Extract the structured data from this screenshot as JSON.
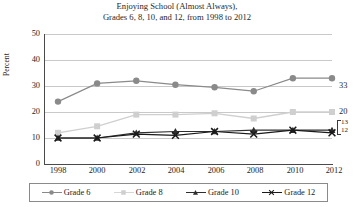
{
  "chart_data": {
    "type": "line",
    "title": "Enjoying School (Almost Always),",
    "subtitle": "Grades 6, 8, 10, and 12, from 1998 to 2012",
    "xlabel": "",
    "ylabel": "Percent",
    "x": [
      1998,
      2000,
      2002,
      2004,
      2006,
      2008,
      2010,
      2012
    ],
    "xticklabels": [
      "1998",
      "2000",
      "2002",
      "2004",
      "2006",
      "2008",
      "2010",
      "2012"
    ],
    "yticklabels": [
      "0",
      "10",
      "20",
      "30",
      "40",
      "50"
    ],
    "ylim": [
      0,
      50
    ],
    "ytick_step": 10,
    "grid": "horizontal",
    "legend_position": "bottom",
    "series": [
      {
        "name": "Grade 6",
        "marker": "circle",
        "color": "#8a8a8a",
        "values": [
          24,
          31,
          32,
          30.5,
          29.5,
          28,
          33,
          33
        ],
        "end_label": "33"
      },
      {
        "name": "Grade 8",
        "marker": "square",
        "color": "#cfcfcf",
        "values": [
          12,
          14.5,
          19,
          19,
          19.5,
          17.5,
          20,
          20
        ],
        "end_label": "20"
      },
      {
        "name": "Grade 10",
        "marker": "triangle",
        "color": "#2e2e2e",
        "values": [
          10,
          10,
          12,
          12.5,
          12.5,
          13,
          13,
          13
        ],
        "end_label": "13"
      },
      {
        "name": "Grade 12",
        "marker": "x",
        "color": "#1a1a1a",
        "values": [
          10,
          10,
          11.5,
          11,
          12.5,
          11.5,
          13,
          12
        ],
        "end_label": "12"
      }
    ],
    "end_bracket_labels": [
      "13",
      "12"
    ]
  }
}
